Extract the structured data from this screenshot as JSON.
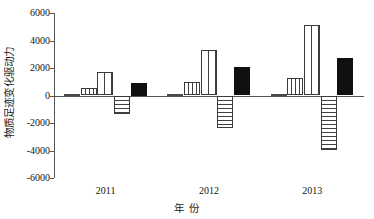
{
  "chart_data": {
    "type": "bar",
    "title": "",
    "subtitle": "",
    "xlabel": "年 份",
    "ylabel": "物质足迹变化驱动力",
    "categories": [
      "2011",
      "2012",
      "2013"
    ],
    "ylim": [
      -6000,
      6000
    ],
    "yticks": [
      6000,
      4000,
      2000,
      0,
      -2000,
      -4000,
      -6000
    ],
    "ytick_labels": [
      "6000",
      "4000",
      "2000",
      "0",
      "-2000",
      "-4000",
      "-6000"
    ],
    "grid": false,
    "legend_position": "none",
    "series": [
      {
        "name": "effect-1",
        "pattern": "solid-small",
        "values": [
          100,
          90,
          80
        ]
      },
      {
        "name": "effect-2",
        "pattern": "vertical-lines",
        "values": [
          550,
          960,
          1290
        ]
      },
      {
        "name": "effect-3",
        "pattern": "grid-crosshatch",
        "values": [
          1730,
          3280,
          5130
        ]
      },
      {
        "name": "effect-4",
        "pattern": "horizontal-lines",
        "values": [
          -1380,
          -2370,
          -3980
        ]
      },
      {
        "name": "effect-5",
        "pattern": "solid-black",
        "values": [
          900,
          2060,
          2760
        ]
      }
    ]
  }
}
